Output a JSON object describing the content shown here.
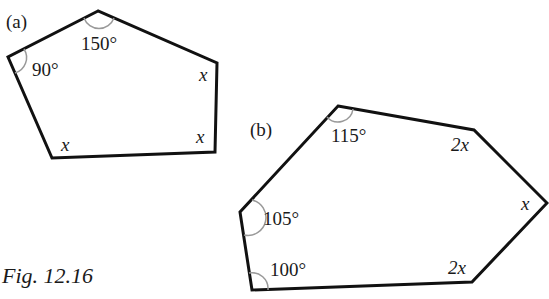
{
  "figure": {
    "caption": "Fig. 12.16",
    "a": {
      "label": "(a)",
      "shape": "pentagon",
      "angles": {
        "top": "150°",
        "left": "90°",
        "right": "x",
        "bottom_right": "x",
        "bottom_left": "x"
      }
    },
    "b": {
      "label": "(b)",
      "shape": "hexagon",
      "angles": {
        "top": "115°",
        "top_right": "2x",
        "right": "x",
        "bottom_right": "2x",
        "bottom_left": "100°",
        "left": "105°"
      }
    }
  }
}
